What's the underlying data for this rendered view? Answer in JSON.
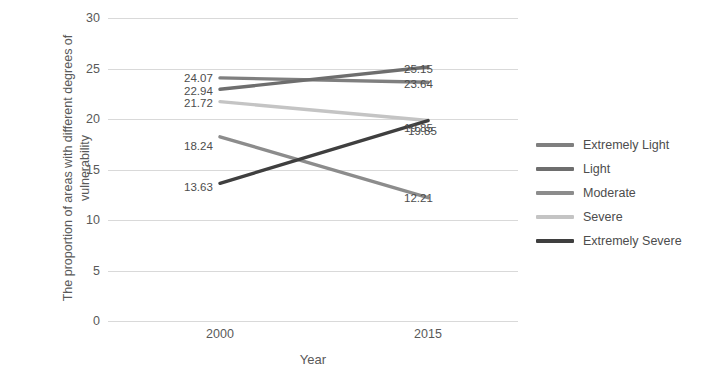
{
  "chart_data": {
    "type": "line",
    "title": "",
    "xlabel": "Year",
    "ylabel": "The proportion of areas with different degrees of vulnerability",
    "categories": [
      "2000",
      "2015"
    ],
    "x": [
      2000,
      2015
    ],
    "ylim": [
      0,
      30
    ],
    "yticks": [
      0,
      5,
      10,
      15,
      20,
      25,
      30
    ],
    "ytick_labels": [
      "0",
      "5",
      "10",
      "15",
      "20",
      "25",
      "30"
    ],
    "grid": true,
    "legend_position": "right",
    "series": [
      {
        "name": "Extremely Light",
        "color": "#7f7f7f",
        "values": [
          24.07,
          23.64
        ],
        "labels": [
          "24.07",
          "23.64"
        ]
      },
      {
        "name": "Light",
        "color": "#6e6e6e",
        "values": [
          22.94,
          25.15
        ],
        "labels": [
          "22.94",
          "25.15"
        ]
      },
      {
        "name": "Moderate",
        "color": "#8c8c8c",
        "values": [
          18.24,
          12.21
        ],
        "labels": [
          "18.24",
          "12.21"
        ]
      },
      {
        "name": "Severe",
        "color": "#c4c4c4",
        "values": [
          21.72,
          19.85
        ],
        "labels": [
          "21.72",
          "19.85"
        ]
      },
      {
        "name": "Extremely Severe",
        "color": "#3f3f3f",
        "values": [
          13.63,
          19.85
        ],
        "labels": [
          "13.63",
          "19.85"
        ]
      }
    ]
  },
  "axis": {
    "y_title": "The proportion of areas with different degrees of vulnerability",
    "x_title": "Year",
    "y_ticks": [
      "30",
      "25",
      "20",
      "15",
      "10",
      "5",
      "0"
    ],
    "x_ticks": [
      "2000",
      "2015"
    ]
  },
  "legend": {
    "items": [
      {
        "label": "Extremely Light",
        "color": "#7f7f7f"
      },
      {
        "label": "Light",
        "color": "#6e6e6e"
      },
      {
        "label": "Moderate",
        "color": "#8c8c8c"
      },
      {
        "label": "Severe",
        "color": "#c4c4c4"
      },
      {
        "label": "Extremely Severe",
        "color": "#3f3f3f"
      }
    ]
  },
  "labels": {
    "left": {
      "extremely_light": "24.07",
      "light": "22.94",
      "severe": "21.72",
      "moderate": "18.24",
      "extremely_severe": "13.63"
    },
    "right": {
      "light": "25.15",
      "extremely_light": "23.64",
      "severe": "19.85",
      "extremely_severe": "19.85",
      "moderate": "12.21"
    }
  }
}
